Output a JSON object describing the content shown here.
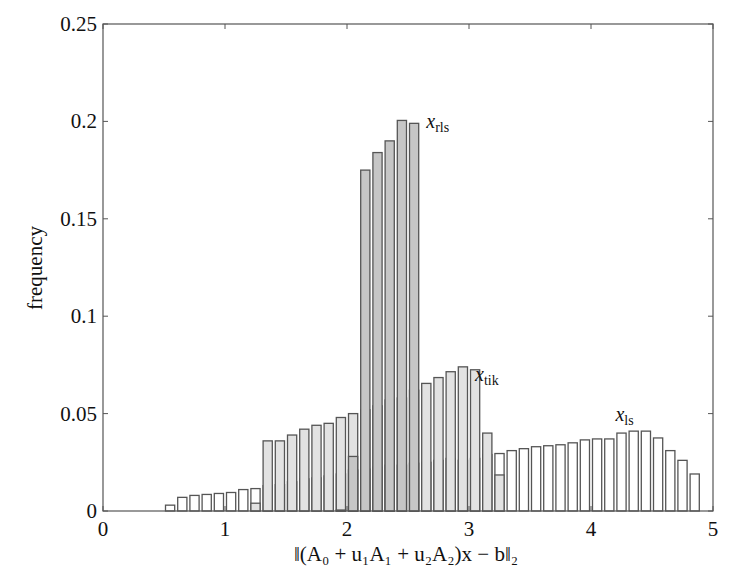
{
  "chart_data": {
    "type": "bar",
    "subtype": "overlapping histogram",
    "title": "",
    "xlabel": "‖(A₀ + u₁A₁ + u₂A₂)x − b‖₂",
    "ylabel": "frequency",
    "xlim": [
      0,
      5
    ],
    "ylim": [
      0,
      0.25
    ],
    "xticks": [
      0,
      1,
      2,
      3,
      4,
      5
    ],
    "xtick_labels": [
      "0",
      "1",
      "2",
      "3",
      "4",
      "5"
    ],
    "yticks": [
      0,
      0.05,
      0.1,
      0.15,
      0.2,
      0.25
    ],
    "ytick_labels": [
      "0",
      "0.05",
      "0.1",
      "0.15",
      "0.2",
      "0.25"
    ],
    "grid": false,
    "legend": "inline labels",
    "bin_width": 0.1,
    "series": [
      {
        "name": "x_ls",
        "label_main": "x",
        "label_sub": "ls",
        "fill": "#ffffff",
        "bin_starts": [
          0.5,
          0.6,
          0.7,
          0.8,
          0.9,
          1.0,
          1.1,
          1.2,
          1.3,
          1.4,
          1.5,
          1.6,
          1.7,
          1.8,
          1.9,
          2.0,
          2.1,
          2.2,
          2.3,
          2.4,
          2.5,
          2.6,
          2.7,
          2.8,
          2.9,
          3.0,
          3.1,
          3.2,
          3.3,
          3.4,
          3.5,
          3.6,
          3.7,
          3.8,
          3.9,
          4.0,
          4.1,
          4.2,
          4.3,
          4.4,
          4.5,
          4.6,
          4.7,
          4.8
        ],
        "values": [
          0.003,
          0.007,
          0.008,
          0.0085,
          0.009,
          0.0095,
          0.011,
          0.0115,
          0.013,
          0.0135,
          0.015,
          0.0165,
          0.017,
          0.018,
          0.019,
          0.021,
          0.0215,
          0.0225,
          0.0235,
          0.0235,
          0.0245,
          0.025,
          0.026,
          0.027,
          0.026,
          0.027,
          0.029,
          0.0295,
          0.031,
          0.032,
          0.033,
          0.0335,
          0.034,
          0.035,
          0.0365,
          0.037,
          0.037,
          0.04,
          0.041,
          0.041,
          0.0375,
          0.031,
          0.026,
          0.019,
          0.013,
          0.0065
        ]
      },
      {
        "name": "x_tik",
        "label_main": "x",
        "label_sub": "tik",
        "fill": "#e2e2e2",
        "bin_starts": [
          1.2,
          1.3,
          1.4,
          1.5,
          1.6,
          1.7,
          1.8,
          1.9,
          2.0,
          2.1,
          2.2,
          2.3,
          2.4,
          2.5,
          2.6,
          2.7,
          2.8,
          2.9,
          3.0,
          3.1,
          3.2
        ],
        "values": [
          0.004,
          0.036,
          0.036,
          0.039,
          0.042,
          0.044,
          0.045,
          0.048,
          0.05,
          0.052,
          0.054,
          0.057,
          0.058,
          0.062,
          0.0655,
          0.0685,
          0.0715,
          0.074,
          0.0725,
          0.04,
          0.0185
        ]
      },
      {
        "name": "x_rls",
        "label_main": "x",
        "label_sub": "rls",
        "fill": "#c6c6c6",
        "bin_starts": [
          1.9,
          2.0,
          2.1,
          2.2,
          2.3,
          2.4,
          2.5
        ],
        "values": [
          0.0005,
          0.028,
          0.175,
          0.184,
          0.19,
          0.2005,
          0.199
        ]
      }
    ],
    "annotations": [
      {
        "text": "x_rls",
        "x": 2.65,
        "y": 0.2
      },
      {
        "text": "x_tik",
        "x": 3.05,
        "y": 0.0705
      },
      {
        "text": "x_ls",
        "x": 4.2,
        "y": 0.05
      }
    ]
  }
}
